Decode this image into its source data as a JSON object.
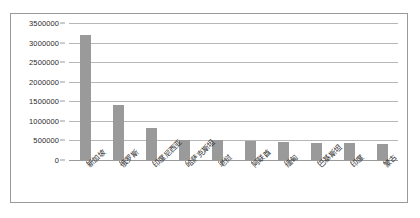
{
  "chart_data": {
    "type": "bar",
    "title": "",
    "subtitle": "",
    "xlabel": "",
    "ylabel": "",
    "grid": true,
    "legend": false,
    "legend_position": "none",
    "bar_color": "#9a9a9a",
    "gridline_color": "#b7b7b7",
    "axis_color": "#9a9a9a",
    "categories": [
      "新加坡",
      "俄罗斯",
      "印度尼西亚",
      "哈萨克斯坦",
      "老挝",
      "阿联酋",
      "缅甸",
      "巴基斯坦",
      "印度",
      "蒙古"
    ],
    "values": [
      3200000,
      1400000,
      820000,
      520000,
      515000,
      490000,
      460000,
      445000,
      425000,
      420000
    ],
    "ylim": [
      0,
      3500000
    ],
    "ytick_values": [
      0,
      500000,
      1000000,
      1500000,
      2000000,
      2500000,
      3000000,
      3500000
    ],
    "ytick_labels": [
      "0",
      "500000",
      "1000000",
      "1500000",
      "2000000",
      "2500000",
      "3000000",
      "3500000"
    ],
    "annotations": []
  }
}
